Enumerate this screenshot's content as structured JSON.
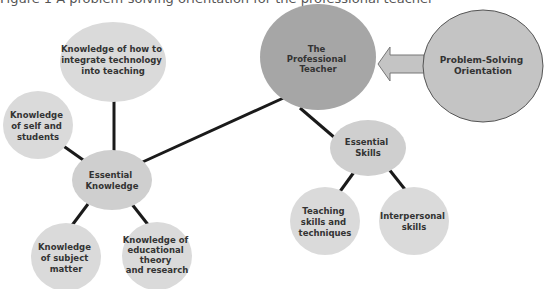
{
  "figure": {
    "title": "Figure 1 A problem-solving orientation for the professional teacher"
  },
  "colors": {
    "light_node": "#dadada",
    "center_node": "#a6a6a6",
    "orientation_node": "#c4c4c4",
    "orientation_outline": "#555555",
    "connector": "#1a1a1a",
    "arrow_fill": "#c4c4c4",
    "arrow_outline": "#777777",
    "text": "#333333"
  },
  "nodes": {
    "professional_teacher": {
      "lines": [
        "The",
        "Professional",
        "Teacher"
      ]
    },
    "problem_solving": {
      "lines": [
        "Problem-Solving",
        "Orientation"
      ]
    },
    "tech_knowledge": {
      "lines": [
        "Knowledge of how to",
        "integrate technology",
        "into teaching"
      ]
    },
    "self_knowledge": {
      "lines": [
        "Knowledge",
        "of self and",
        "students"
      ]
    },
    "essential_knowledge": {
      "lines": [
        "Essential",
        "Knowledge"
      ]
    },
    "essential_skills": {
      "lines": [
        "Essential",
        "Skills"
      ]
    },
    "subject_knowledge": {
      "lines": [
        "Knowledge",
        "of subject",
        "matter"
      ]
    },
    "theory_knowledge": {
      "lines": [
        "Knowledge of",
        "educational",
        "theory",
        "and research"
      ]
    },
    "teaching_skills": {
      "lines": [
        "Teaching",
        "skills and",
        "techniques"
      ]
    },
    "interpersonal_skills": {
      "lines": [
        "Interpersonal",
        "skills"
      ]
    }
  },
  "edges": [
    {
      "from": "professional_teacher",
      "to": "essential_knowledge"
    },
    {
      "from": "professional_teacher",
      "to": "essential_skills"
    },
    {
      "from": "essential_knowledge",
      "to": "tech_knowledge"
    },
    {
      "from": "essential_knowledge",
      "to": "self_knowledge"
    },
    {
      "from": "essential_knowledge",
      "to": "subject_knowledge"
    },
    {
      "from": "essential_knowledge",
      "to": "theory_knowledge"
    },
    {
      "from": "essential_skills",
      "to": "teaching_skills"
    },
    {
      "from": "essential_skills",
      "to": "interpersonal_skills"
    },
    {
      "from": "problem_solving",
      "to": "professional_teacher",
      "type": "block-arrow"
    }
  ]
}
